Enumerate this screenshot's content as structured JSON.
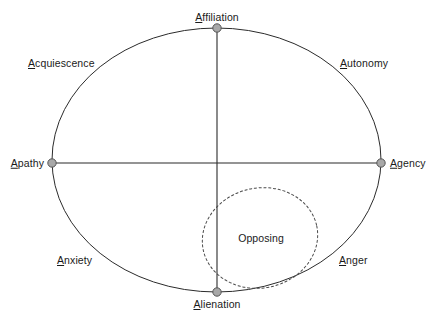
{
  "diagram": {
    "type": "circumplex-ellipse",
    "background_color": "#ffffff",
    "stroke_color": "#2b2b2b",
    "node_fill_color": "#a8a8a8",
    "node_stroke_color": "#555555",
    "text_color": "#1a1a1a",
    "axes": {
      "horizontal": {
        "left_label": "Apathy",
        "right_label": "Agency"
      },
      "vertical": {
        "top_label": "Affiliation",
        "bottom_label": "Alienation"
      }
    },
    "anchors": [
      {
        "id": "affiliation",
        "label": "Affiliation",
        "underline_first": true,
        "position": "top",
        "x": 217,
        "y": 28
      },
      {
        "id": "agency",
        "label": "Agency",
        "underline_first": true,
        "position": "right",
        "x": 381,
        "y": 163
      },
      {
        "id": "alienation",
        "label": "Alienation",
        "underline_first": true,
        "position": "bottom",
        "x": 217,
        "y": 292
      },
      {
        "id": "apathy",
        "label": "Apathy",
        "underline_first": true,
        "position": "left",
        "x": 52,
        "y": 163
      }
    ],
    "quadrants": [
      {
        "id": "acquiescence",
        "label": "Acquiescence",
        "underline_first": true,
        "quadrant": "upper-left",
        "x": 28,
        "y": 63
      },
      {
        "id": "autonomy",
        "label": "Autonomy",
        "underline_first": true,
        "quadrant": "upper-right",
        "x": 340,
        "y": 63
      },
      {
        "id": "anxiety",
        "label": "Anxiety",
        "underline_first": true,
        "quadrant": "lower-left",
        "x": 57,
        "y": 260
      },
      {
        "id": "anger",
        "label": "Anger",
        "underline_first": true,
        "quadrant": "lower-right",
        "x": 339,
        "y": 260
      }
    ],
    "region": {
      "id": "opposing",
      "label": "Opposing",
      "underline_first": false,
      "style": "dashed-ellipse",
      "center_x": 260,
      "center_y": 238,
      "rx": 58,
      "ry": 50,
      "rotation_deg": -12
    }
  }
}
